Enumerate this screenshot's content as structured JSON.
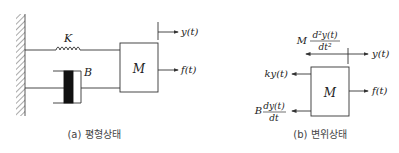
{
  "diagram_a": {
    "spring_label": "K",
    "damper_label": "B",
    "mass_label": "M",
    "output_label": "y(t)",
    "force_label": "f(t)",
    "caption": "(a) 평형상태"
  },
  "diagram_b": {
    "mass_label": "M",
    "inertia_coef": "M",
    "inertia_num": "d²y(t)",
    "inertia_den": "dt²",
    "output_label": "y(t)",
    "spring_force_label": "ky(t)",
    "damper_coef": "B",
    "damper_num": "dy(t)",
    "damper_den": "dt",
    "force_label": "f(t)",
    "caption": "(b) 변위상태"
  },
  "colors": {
    "line": "#333333",
    "hatch": "#555555",
    "damper_fill": "#111111",
    "background": "#ffffff"
  }
}
